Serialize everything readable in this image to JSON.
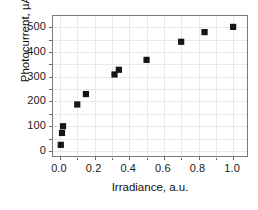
{
  "chart_data": {
    "type": "scatter",
    "title": "",
    "xlabel": "Irradiance, a.u.",
    "ylabel": "Photocurrent, µA",
    "xlim": [
      -0.04,
      1.08
    ],
    "ylim": [
      -20,
      545
    ],
    "xticks": [
      0.0,
      0.2,
      0.4,
      0.6,
      0.8,
      1.0
    ],
    "xticklabels": [
      "0.0",
      "0.2",
      "0.4",
      "0.6",
      "0.8",
      "1.0"
    ],
    "yticks": [
      0,
      100,
      200,
      300,
      400,
      500
    ],
    "yticklabels": [
      "0",
      "100",
      "200",
      "300",
      "400",
      "500"
    ],
    "grid": true,
    "legend": null,
    "marker": "square",
    "marker_color": "#151515",
    "series": [
      {
        "name": "photocurrent",
        "x": [
          0.005,
          0.012,
          0.018,
          0.1,
          0.15,
          0.315,
          0.34,
          0.5,
          0.7,
          0.835,
          1.0
        ],
        "y": [
          25,
          73,
          100,
          188,
          230,
          309,
          328,
          368,
          441,
          480,
          501
        ]
      }
    ]
  },
  "axes": {
    "x_minor_count": 1,
    "y_minor_count": 1
  },
  "colors": {
    "marker": "#151515",
    "frame": "#7a7a7a",
    "grid": "#e9e9e9",
    "text": "#111111",
    "background": "#ffffff"
  }
}
